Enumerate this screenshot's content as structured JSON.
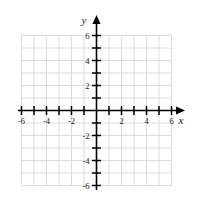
{
  "chart_data": {
    "type": "scatter",
    "title": "",
    "subtitle": "",
    "xlabel": "x",
    "ylabel": "y",
    "xlim": [
      -6,
      6
    ],
    "ylim": [
      -6,
      6
    ],
    "grid": true,
    "legend": "none",
    "x_tick_labels": [
      "-6",
      "-4",
      "-2",
      "2",
      "4",
      "6"
    ],
    "x_tick_values": [
      -6,
      -4,
      -2,
      2,
      4,
      6
    ],
    "y_tick_labels": [
      "6",
      "4",
      "2",
      "-2",
      "-4",
      "-6"
    ],
    "y_tick_values": [
      6,
      4,
      2,
      -2,
      -4,
      -6
    ],
    "x_minor_ticks": [
      -6,
      -5,
      -4,
      -3,
      -2,
      -1,
      1,
      2,
      3,
      4,
      5,
      6
    ],
    "y_minor_ticks": [
      -6,
      -5,
      -4,
      -3,
      -2,
      -1,
      1,
      2,
      3,
      4,
      5,
      6
    ],
    "x_grid_lines": [
      -6,
      -5,
      -4,
      -3,
      -2,
      -1,
      0,
      1,
      2,
      3,
      4,
      5,
      6
    ],
    "y_grid_lines": [
      -6,
      -5,
      -4,
      -3,
      -2,
      -1,
      0,
      1,
      2,
      3,
      4,
      5,
      6
    ],
    "origin_label": "",
    "series": [],
    "values": [],
    "categories": [],
    "colors": {
      "background": "#ffffff",
      "grid": "#dcdcdc",
      "axis": "#000000",
      "text": "#1a1a1a"
    }
  },
  "axes": {
    "x_name": "x",
    "y_name": "y"
  },
  "ticks": {
    "x": [
      {
        "value": -6,
        "label": "-6"
      },
      {
        "value": -5,
        "label": ""
      },
      {
        "value": -4,
        "label": "-4"
      },
      {
        "value": -3,
        "label": ""
      },
      {
        "value": -2,
        "label": "-2"
      },
      {
        "value": -1,
        "label": ""
      },
      {
        "value": 1,
        "label": ""
      },
      {
        "value": 2,
        "label": "2"
      },
      {
        "value": 3,
        "label": ""
      },
      {
        "value": 4,
        "label": "4"
      },
      {
        "value": 5,
        "label": ""
      },
      {
        "value": 6,
        "label": "6"
      }
    ],
    "y": [
      {
        "value": 6,
        "label": "6"
      },
      {
        "value": 5,
        "label": ""
      },
      {
        "value": 4,
        "label": "4"
      },
      {
        "value": 3,
        "label": ""
      },
      {
        "value": 2,
        "label": "2"
      },
      {
        "value": 1,
        "label": ""
      },
      {
        "value": -1,
        "label": ""
      },
      {
        "value": -2,
        "label": "-2"
      },
      {
        "value": -3,
        "label": ""
      },
      {
        "value": -4,
        "label": "-4"
      },
      {
        "value": -5,
        "label": ""
      },
      {
        "value": -6,
        "label": "-6"
      }
    ]
  }
}
